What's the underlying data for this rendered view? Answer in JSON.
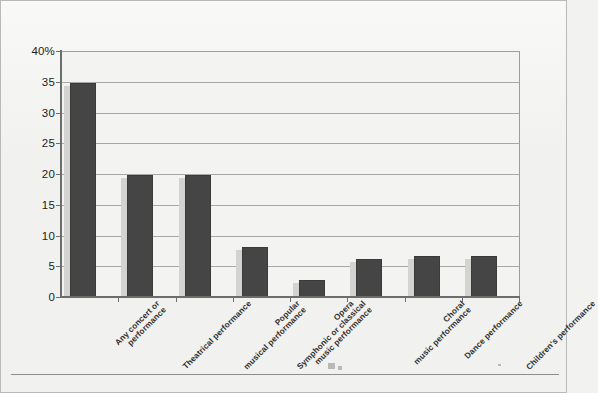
{
  "chart_data": {
    "type": "bar",
    "title": "",
    "subtitle": "",
    "xlabel": "",
    "ylabel": "",
    "ylim": [
      0,
      40
    ],
    "grid": true,
    "legend": "none",
    "y_axis_unit": "%",
    "y_tick_labels": [
      "40%",
      "35",
      "30",
      "25",
      "20",
      "15",
      "10",
      "5",
      "0"
    ],
    "y_tick_values": [
      40,
      35,
      30,
      25,
      20,
      15,
      10,
      5,
      0
    ],
    "categories": [
      "Any concert or performance",
      "Theatrical performance",
      "Popular musical performance",
      "Symphonic or classical music performance",
      "Opera",
      "Choral music performance",
      "Dance performance",
      "Children's performance"
    ],
    "category_lines": [
      [
        "Any concert or",
        "performance"
      ],
      [
        "Theatrical performance"
      ],
      [
        "Popular",
        "musical performance"
      ],
      [
        "Symphonic or classical",
        "music performance"
      ],
      [
        "Opera"
      ],
      [
        "Choral",
        "music performance"
      ],
      [
        "Dance performance"
      ],
      [
        "Children's performance"
      ]
    ],
    "values": [
      34.8,
      19.9,
      19.9,
      8.2,
      2.7,
      6.2,
      6.6,
      6.6
    ],
    "series": [
      {
        "name": "Percent of adults attending",
        "values": [
          34.8,
          19.9,
          19.9,
          8.2,
          2.7,
          6.2,
          6.6,
          6.6
        ]
      }
    ]
  },
  "style": {
    "bar_color": "#454545",
    "bar_shadow_color": "#d3d3d1",
    "plot_background": "#f3f3f1",
    "page_background": "#f1f1ef",
    "gridline_color": "#a8a8a6",
    "axis_color": "#6d6d6b",
    "text_color": "#1d1d1d"
  }
}
